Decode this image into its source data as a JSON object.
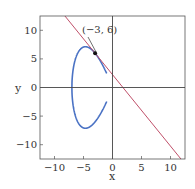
{
  "chart_data": {
    "type": "line",
    "title": "",
    "xlabel": "x",
    "ylabel": "y",
    "xlim": [
      -12.5,
      12.5
    ],
    "ylim": [
      -12.5,
      12.5
    ],
    "xticks": [
      -10,
      -5,
      0,
      5,
      10
    ],
    "yticks": [
      -10,
      -5,
      0,
      5,
      10
    ],
    "xtick_labels": [
      "−10",
      "−5",
      "0",
      "5",
      "10"
    ],
    "ytick_labels": [
      "−10",
      "−5",
      "0",
      "5",
      "10"
    ],
    "grid": false,
    "series": [
      {
        "name": "curve y^2 = x^3 + 7x^2",
        "color": "#4a72c4",
        "equation": "y^2 = x^3 + 7x^2"
      },
      {
        "name": "tangent line at (-3, 6)",
        "color": "#c0506a",
        "equation": "y = -1.25x + 2.25"
      }
    ],
    "annotations": [
      {
        "text": "(−3, 6)",
        "x": -3,
        "y": 6
      }
    ]
  }
}
